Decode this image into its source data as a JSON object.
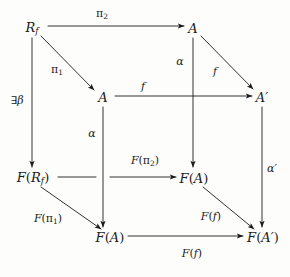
{
  "figure": {
    "kind": "commutative-diagram",
    "shape": "cube",
    "ink_color": "#1b1b1b",
    "background_color": "#fdfdfc",
    "width": 290,
    "height": 277
  },
  "nodes": [
    {
      "id": "Rf",
      "text": "R",
      "sub": "f",
      "prime": "",
      "x": 32,
      "y": 28,
      "full": "R_f"
    },
    {
      "id": "A_tr",
      "text": "A",
      "sub": "",
      "prime": "",
      "x": 193,
      "y": 28,
      "full": "A"
    },
    {
      "id": "A_mid",
      "text": "A",
      "sub": "",
      "prime": "",
      "x": 103,
      "y": 97,
      "full": "A"
    },
    {
      "id": "Ap",
      "text": "A",
      "sub": "",
      "prime": "'",
      "x": 262,
      "y": 97,
      "full": "A'"
    },
    {
      "id": "FRf",
      "text": "F(R",
      "sub": "f",
      "prime": ")",
      "x": 33,
      "y": 178,
      "full": "F(R_f)"
    },
    {
      "id": "FA_mr",
      "text": "F(A)",
      "sub": "",
      "prime": "",
      "x": 194,
      "y": 178,
      "full": "F(A)"
    },
    {
      "id": "FA_bl",
      "text": "F(A)",
      "sub": "",
      "prime": "",
      "x": 110,
      "y": 237,
      "full": "F(A)"
    },
    {
      "id": "FAp",
      "text": "F(A",
      "sub": "",
      "prime": "')",
      "x": 263,
      "y": 237,
      "full": "F(A')"
    }
  ],
  "edges": [
    {
      "id": "pi2",
      "from": "Rf",
      "to": "A_tr",
      "label": "π₂",
      "label_x": 102,
      "label_y": 14,
      "style": "horizontal"
    },
    {
      "id": "pi1",
      "from": "Rf",
      "to": "A_mid",
      "label": "π₁",
      "label_x": 57,
      "label_y": 70,
      "style": "diagonal"
    },
    {
      "id": "beta",
      "from": "Rf",
      "to": "FRf",
      "label": "∃β",
      "label_x": 17,
      "label_y": 100,
      "style": "vertical"
    },
    {
      "id": "alpha_tr",
      "from": "A_tr",
      "to": "FA_mr",
      "label": "α",
      "label_x": 180,
      "label_y": 61,
      "style": "vertical"
    },
    {
      "id": "f_diag",
      "from": "A_tr",
      "to": "Ap",
      "label": "f",
      "label_x": 215,
      "label_y": 71,
      "style": "diagonal"
    },
    {
      "id": "f_mid",
      "from": "A_mid",
      "to": "Ap",
      "label": "f",
      "label_x": 143,
      "label_y": 86,
      "style": "horizontal"
    },
    {
      "id": "alpha_mid",
      "from": "A_mid",
      "to": "FA_bl",
      "label": "α",
      "label_x": 92,
      "label_y": 133,
      "style": "vertical"
    },
    {
      "id": "alpha_pr",
      "from": "Ap",
      "to": "FAp",
      "label": "α'",
      "label_x": 272,
      "label_y": 168,
      "style": "vertical"
    },
    {
      "id": "Fpi2",
      "from": "FRf",
      "to": "FA_mr",
      "label": "F(π₂)",
      "label_x": 145,
      "label_y": 161,
      "style": "horizontal"
    },
    {
      "id": "Fpi1",
      "from": "FRf",
      "to": "FA_bl",
      "label": "F(π₁)",
      "label_x": 48,
      "label_y": 219,
      "style": "diagonal"
    },
    {
      "id": "Ff_diag",
      "from": "FA_mr",
      "to": "FAp",
      "label": "F(f)",
      "label_x": 211,
      "label_y": 216,
      "style": "diagonal"
    },
    {
      "id": "Ff_bot",
      "from": "FA_bl",
      "to": "FAp",
      "label": "F(f)",
      "label_x": 192,
      "label_y": 253,
      "style": "horizontal"
    }
  ],
  "labels": {
    "pi2": "π₂",
    "pi1": "π₁",
    "exists_beta": "∃β",
    "alpha": "α",
    "alpha_prime": "α'",
    "f": "f",
    "F_pi2": "F(π₂)",
    "F_pi1": "F(π₁)",
    "F_f": "F(f)"
  }
}
